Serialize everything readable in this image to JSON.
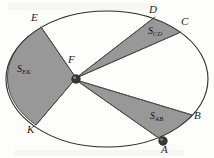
{
  "figure": {
    "kind": "geometry-diagram",
    "background_color": "#fdfdfc",
    "outline_color": "#2b2b2b",
    "sector_fill_color": "#989898",
    "sector_stroke_color": "#4a4a4a",
    "marker_color": "#3a3a3a"
  },
  "points": [
    {
      "id": "E",
      "label": "E",
      "x": 34,
      "y": 18,
      "marker": false
    },
    {
      "id": "D",
      "label": "D",
      "x": 152,
      "y": 10,
      "marker": false
    },
    {
      "id": "C",
      "label": "C",
      "x": 183,
      "y": 24,
      "marker": false
    },
    {
      "id": "F",
      "label": "F",
      "x": 72,
      "y": 56,
      "marker": true
    },
    {
      "id": "B",
      "label": "B",
      "x": 196,
      "y": 117,
      "marker": false
    },
    {
      "id": "K",
      "label": "K",
      "x": 30,
      "y": 131,
      "marker": false
    },
    {
      "id": "A",
      "label": "A",
      "x": 163,
      "y": 146,
      "marker": true
    }
  ],
  "sectors": [
    {
      "id": "EK",
      "base": "S",
      "subscript": "EK",
      "label_x": 20,
      "label_y": 68,
      "shaded": true
    },
    {
      "id": "CD",
      "base": "S",
      "subscript": "CD",
      "label_x": 150,
      "label_y": 30,
      "shaded": true
    },
    {
      "id": "AB",
      "base": "S",
      "subscript": "AB",
      "label_x": 152,
      "label_y": 115,
      "shaded": true
    }
  ]
}
